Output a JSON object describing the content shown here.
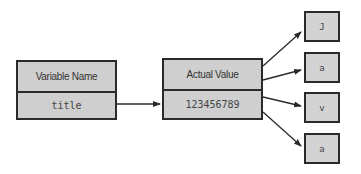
{
  "variable_box": {
    "header": "Variable Name",
    "value": "title"
  },
  "value_box": {
    "header": "Actual Value",
    "value": "123456789"
  },
  "characters": [
    "J",
    "a",
    "v",
    "a"
  ],
  "colors": {
    "box_fill": "#cfcfcf",
    "border": "#2a2a2a",
    "arrow": "#2a2a2a"
  }
}
